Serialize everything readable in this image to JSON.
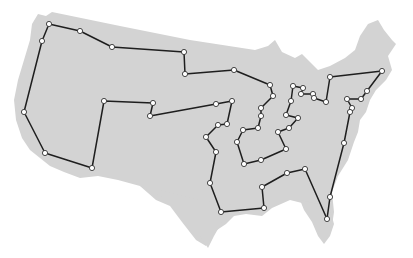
{
  "map": {
    "title": "",
    "land_color": "#d3d3d3",
    "route_color": "#1e1e1e",
    "stop_fill": "#ffffff",
    "stop_stroke": "#333333",
    "route_closed": true,
    "stops": [
      [
        49,
        24
      ],
      [
        80,
        31
      ],
      [
        112,
        47
      ],
      [
        184,
        52
      ],
      [
        185,
        74
      ],
      [
        234,
        70
      ],
      [
        270,
        85
      ],
      [
        273,
        96
      ],
      [
        261,
        108
      ],
      [
        261,
        116
      ],
      [
        258,
        128
      ],
      [
        243,
        130
      ],
      [
        237,
        142
      ],
      [
        244,
        164
      ],
      [
        261,
        160
      ],
      [
        286,
        149
      ],
      [
        278,
        132
      ],
      [
        289,
        128
      ],
      [
        298,
        118
      ],
      [
        286,
        115
      ],
      [
        291,
        101
      ],
      [
        293,
        86
      ],
      [
        303,
        88
      ],
      [
        301,
        94
      ],
      [
        313,
        94
      ],
      [
        314,
        98
      ],
      [
        326,
        102
      ],
      [
        330,
        77
      ],
      [
        382,
        71
      ],
      [
        367,
        91
      ],
      [
        361,
        99
      ],
      [
        347,
        99
      ],
      [
        352,
        108
      ],
      [
        350,
        112
      ],
      [
        344,
        143
      ],
      [
        330,
        197
      ],
      [
        327,
        219
      ],
      [
        305,
        169
      ],
      [
        287,
        173
      ],
      [
        262,
        187
      ],
      [
        264,
        208
      ],
      [
        221,
        212
      ],
      [
        210,
        183
      ],
      [
        216,
        152
      ],
      [
        206,
        137
      ],
      [
        218,
        125
      ],
      [
        227,
        124
      ],
      [
        232,
        101
      ],
      [
        216,
        104
      ],
      [
        150,
        116
      ],
      [
        153,
        103
      ],
      [
        104,
        101
      ],
      [
        92,
        168
      ],
      [
        45,
        153
      ],
      [
        24,
        112
      ],
      [
        42,
        41
      ]
    ]
  }
}
